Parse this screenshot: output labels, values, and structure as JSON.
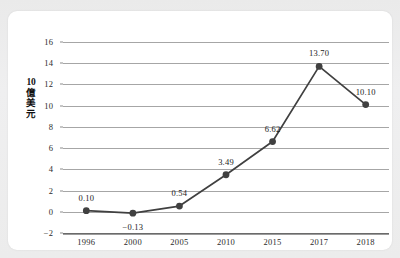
{
  "chart_data": {
    "type": "line",
    "title": "",
    "xlabel": "",
    "ylabel": "10億美元",
    "ylabel_lines": [
      "10",
      "億",
      "美",
      "元"
    ],
    "categories": [
      "1996",
      "2000",
      "2005",
      "2010",
      "2015",
      "2017",
      "2018"
    ],
    "values": [
      0.1,
      -0.13,
      0.54,
      3.49,
      6.62,
      13.7,
      10.1
    ],
    "point_labels": [
      "0.10",
      "−0.13",
      "0.54",
      "3.49",
      "6.62",
      "13.70",
      "10.10"
    ],
    "point_label_position": [
      "above",
      "below",
      "above",
      "above",
      "above",
      "above",
      "above"
    ],
    "ylim": [
      -2,
      16
    ],
    "ytick_values": [
      16,
      14,
      12,
      10,
      8,
      6,
      4,
      2,
      0,
      -2
    ],
    "ytick_labels": [
      "16",
      "14",
      "12",
      "10",
      "8",
      "6",
      "4",
      "2",
      "0",
      "−2"
    ],
    "grid": true,
    "grid_axis": "y",
    "legend": false,
    "legend_position": "none",
    "marker": "circle",
    "series_color": "#404040",
    "grid_color": "#a6a6a6",
    "axis_color": "#6a6a6a",
    "text_color": "#2b2b2b",
    "card_color": "#ffffff",
    "page_color": "#ececec"
  }
}
